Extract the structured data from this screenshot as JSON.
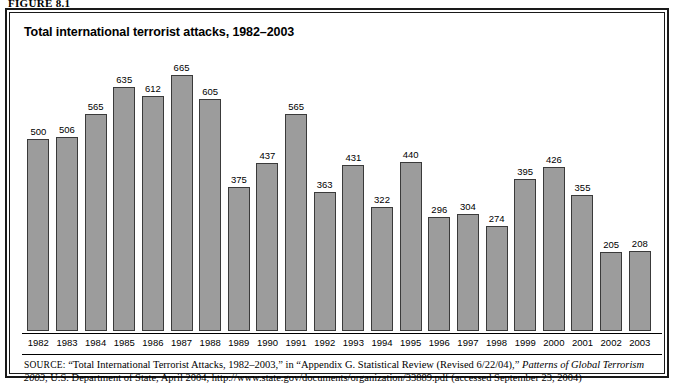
{
  "figure": {
    "label": "FIGURE 8.1",
    "title": "Total international terrorist attacks, 1982–2003"
  },
  "source": {
    "prefix": "SOURCE:",
    "line1_a": "“Total International Terrorist Attacks, 1982–2003,” in “Appendix G. Statistical Review (Revised 6/22/04),” ",
    "line1_italic": "Patterns of Global Terrorism 2003",
    "line1_b": ",",
    "line2": "U.S. Department of State, April 2004, http://www.state.gov/documents/organization/33889.pdf (accessed September 23, 2004)"
  },
  "colors": {
    "bar_fill": "#9c9c9c",
    "bar_stroke": "#3a3a3a",
    "border": "#1a1a1a",
    "text": "#000000",
    "background": "#ffffff"
  },
  "chart_data": {
    "type": "bar",
    "title": "Total international terrorist attacks, 1982–2003",
    "xlabel": "",
    "ylabel": "",
    "ylim": [
      0,
      700
    ],
    "grid": false,
    "legend": null,
    "data_labels": true,
    "categories": [
      "1982",
      "1983",
      "1984",
      "1985",
      "1986",
      "1987",
      "1988",
      "1989",
      "1990",
      "1991",
      "1992",
      "1993",
      "1994",
      "1995",
      "1996",
      "1997",
      "1998",
      "1999",
      "2000",
      "2001",
      "2002",
      "2003"
    ],
    "values": [
      500,
      506,
      565,
      635,
      612,
      665,
      605,
      375,
      437,
      565,
      363,
      431,
      322,
      440,
      296,
      304,
      274,
      395,
      426,
      355,
      205,
      208
    ]
  }
}
